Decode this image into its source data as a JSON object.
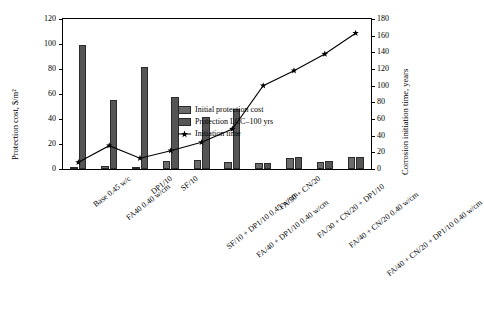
{
  "chart_data": {
    "type": "bar",
    "title": "",
    "xlabel": "",
    "ylabel": "Protection cost, $/m2",
    "ylabel_display": "Protection cost, $/m²",
    "y2label": "Corrosion initiation time, years",
    "ylim": [
      0,
      120
    ],
    "y2lim": [
      0,
      180
    ],
    "yticks": [
      0,
      20,
      40,
      60,
      80,
      100,
      120
    ],
    "y2ticks": [
      0,
      20,
      40,
      60,
      80,
      100,
      120,
      140,
      160,
      180
    ],
    "grid": false,
    "legend_position": "inside-center",
    "categories": [
      "Base 0.45 w/c",
      "FA40 0.40 w/cm",
      "DP1/10",
      "SF/10",
      "SF/10 + DP1/10 0.45 w/cm",
      "FA/40 + DP1/10 0.40 w/cm",
      "FA/30 + CN/20",
      "FA/30 + CN/20 + DP1/10",
      "FA/40 + CN/20 0.40 w/cm",
      "FA/40 + CN/20 + DP1/10 0.40 w/cm"
    ],
    "series": [
      {
        "name": "Initial protection cost",
        "type": "bar",
        "axis": "left",
        "color": "#6b6b6b",
        "values": [
          0.5,
          2.5,
          1.0,
          6.5,
          7.0,
          6.0,
          4.5,
          9.0,
          6.0,
          9.5
        ]
      },
      {
        "name": "Protection LCC–100 yrs",
        "type": "bar",
        "axis": "left",
        "color": "#555555",
        "values": [
          99,
          55,
          82,
          58,
          42,
          48,
          5,
          9.5,
          6.5,
          10
        ]
      },
      {
        "name": "Initiation time",
        "type": "line",
        "axis": "right",
        "color": "#000000",
        "marker": "star",
        "values": [
          8,
          28,
          13,
          22,
          32,
          48,
          100,
          118,
          138,
          163
        ]
      }
    ]
  },
  "legend": {
    "items": [
      {
        "label": "Initial protection cost",
        "key": "swatch2"
      },
      {
        "label": "Protection LCC–100 yrs",
        "key": "swatch"
      },
      {
        "label": "Initiation time",
        "key": "line"
      }
    ]
  }
}
